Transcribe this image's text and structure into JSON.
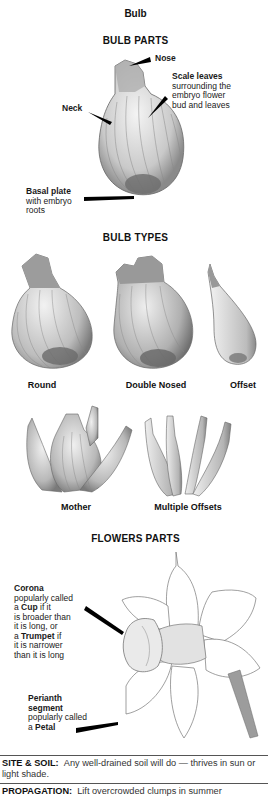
{
  "page": {
    "title": "Bulb"
  },
  "bulb_parts": {
    "heading": "BULB PARTS",
    "labels": {
      "nose": "Nose",
      "scale_leaves_title": "Scale leaves",
      "scale_leaves_desc_1": "surrounding the",
      "scale_leaves_desc_2": "embryo flower",
      "scale_leaves_desc_3": "bud and leaves",
      "neck": "Neck",
      "basal_plate_title": "Basal plate",
      "basal_plate_desc_1": "with embryo",
      "basal_plate_desc_2": "roots"
    }
  },
  "bulb_types": {
    "heading": "BULB TYPES",
    "items": [
      {
        "label": "Round"
      },
      {
        "label": "Double Nosed"
      },
      {
        "label": "Offset"
      },
      {
        "label": "Mother"
      },
      {
        "label": "Multiple Offsets"
      }
    ]
  },
  "flower_parts": {
    "heading": "FLOWERS PARTS",
    "corona": {
      "title": "Corona",
      "l1": "popularly called",
      "l2_pre": "a ",
      "l2_bold": "Cup",
      "l2_post": " if it",
      "l3": "is broader than",
      "l4": "it is long, or",
      "l5_pre": "a ",
      "l5_bold": "Trumpet",
      "l5_post": " if",
      "l6": "it is narrower",
      "l7": "than it is long"
    },
    "perianth": {
      "title_1": "Perianth",
      "title_2": "segment",
      "l1": "popularly called",
      "l2_pre": "a ",
      "l2_bold": "Petal"
    }
  },
  "info": {
    "site_soil": {
      "key": "SITE & SOIL:",
      "text": "Any well-drained soil will do — thrives in sun or light shade."
    },
    "propagation": {
      "key": "PROPAGATION:",
      "text": "Lift overcrowded clumps in summer"
    }
  }
}
